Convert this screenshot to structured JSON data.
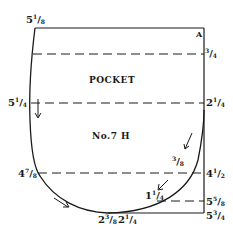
{
  "diagram": {
    "title": "POCKET",
    "pattern_number": "No.7 H",
    "corner_label": "A",
    "top_left_measure": {
      "whole": "5",
      "num": "1",
      "den": "8"
    },
    "left_measures": [
      {
        "id": "left-1",
        "whole": "5",
        "num": "1",
        "den": "4"
      },
      {
        "id": "left-2",
        "whole": "4",
        "num": "7",
        "den": "8"
      }
    ],
    "right_measures": [
      {
        "id": "right-1",
        "whole": "",
        "num": "3",
        "den": "4"
      },
      {
        "id": "right-2",
        "whole": "2",
        "num": "1",
        "den": "4"
      },
      {
        "id": "right-3",
        "whole": "4",
        "num": "1",
        "den": "2"
      },
      {
        "id": "right-4",
        "whole": "5",
        "num": "5",
        "den": "8"
      },
      {
        "id": "right-5",
        "whole": "5",
        "num": "3",
        "den": "4"
      }
    ],
    "curve_measures": [
      {
        "id": "curve-1",
        "whole": "",
        "num": "3",
        "den": "8"
      },
      {
        "id": "curve-2",
        "whole": "1",
        "num": "1",
        "den": "4"
      }
    ],
    "bottom_measures": [
      {
        "id": "bottom-1",
        "whole": "2",
        "num": "3",
        "den": "8"
      },
      {
        "id": "bottom-2",
        "whole": "2",
        "num": "1",
        "den": "4"
      }
    ],
    "line_color": "#1a1a1a",
    "background": "#ffffff"
  }
}
